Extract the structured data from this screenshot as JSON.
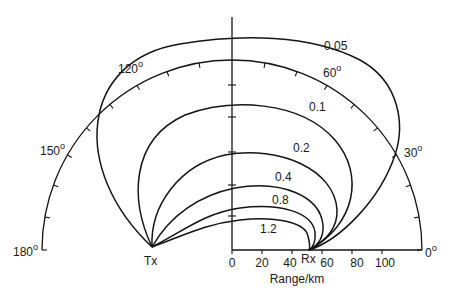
{
  "figure": {
    "type": "polar contour diagram",
    "x_axis": {
      "label": "Range/km",
      "ticks": [
        "0",
        "20",
        "40",
        "60",
        "80",
        "100"
      ]
    },
    "angle_scale": {
      "labels": [
        "180°",
        "150°",
        "120°",
        "60°",
        "30°",
        "0°"
      ],
      "label_0": "0",
      "label_30": "30",
      "label_60": "60",
      "label_120": "120",
      "label_150": "150",
      "label_180": "180",
      "degree_symbol": "o"
    },
    "points": {
      "transmitter": "Tx",
      "receiver": "Rx"
    },
    "contours": [
      {
        "label": "0.05"
      },
      {
        "label": "0.1"
      },
      {
        "label": "0.2"
      },
      {
        "label": "0.4"
      },
      {
        "label": "0.8"
      },
      {
        "label": "1.2"
      }
    ]
  }
}
